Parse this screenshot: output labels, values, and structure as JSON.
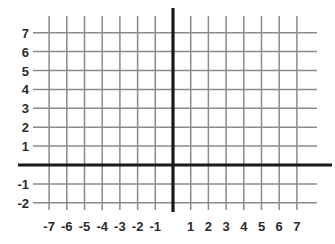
{
  "figure": {
    "kind": "cartesian-coordinate-grid",
    "background_color": "#ffffff",
    "grid_line_color": "#8a8a8a",
    "axis_color": "#1a1a1a",
    "label_color": "#2b2b2b",
    "grid_visible": true
  },
  "chart_data": {
    "type": "scatter",
    "title": "",
    "subtitle": "",
    "xlabel": "",
    "ylabel": "",
    "xlim": [
      -7.8,
      7.8
    ],
    "ylim": [
      -2.8,
      7.8
    ],
    "xticks": [
      -7,
      -6,
      -5,
      -4,
      -3,
      -2,
      -1,
      1,
      2,
      3,
      4,
      5,
      6,
      7
    ],
    "yticks": [
      7,
      6,
      5,
      4,
      3,
      2,
      1,
      -1,
      -2
    ],
    "x_tick_labels": [
      "-7",
      "-6",
      "-5",
      "-4",
      "-3",
      "-2",
      "-1",
      "1",
      "2",
      "3",
      "4",
      "5",
      "6",
      "7"
    ],
    "y_tick_labels": [
      "7",
      "6",
      "5",
      "4",
      "3",
      "2",
      "1",
      "-1",
      "-2"
    ],
    "grid": true,
    "legend": null,
    "series": [],
    "annotations": []
  },
  "axes": {
    "x_axis_label": "",
    "y_axis_label": "",
    "origin_label": ""
  },
  "y_labels": [
    {
      "text": "7",
      "value": 7
    },
    {
      "text": "6",
      "value": 6
    },
    {
      "text": "5",
      "value": 5
    },
    {
      "text": "4",
      "value": 4
    },
    {
      "text": "3",
      "value": 3
    },
    {
      "text": "2",
      "value": 2
    },
    {
      "text": "1",
      "value": 1
    },
    {
      "text": "-1",
      "value": -1
    },
    {
      "text": "-2",
      "value": -2
    }
  ],
  "x_labels": [
    {
      "text": "-7",
      "value": -7
    },
    {
      "text": "-6",
      "value": -6
    },
    {
      "text": "-5",
      "value": -5
    },
    {
      "text": "-4",
      "value": -4
    },
    {
      "text": "-3",
      "value": -3
    },
    {
      "text": "-2",
      "value": -2
    },
    {
      "text": "-1",
      "value": -1
    },
    {
      "text": "1",
      "value": 1
    },
    {
      "text": "2",
      "value": 2
    },
    {
      "text": "3",
      "value": 3
    },
    {
      "text": "4",
      "value": 4
    },
    {
      "text": "5",
      "value": 5
    },
    {
      "text": "6",
      "value": 6
    },
    {
      "text": "7",
      "value": 7
    }
  ]
}
